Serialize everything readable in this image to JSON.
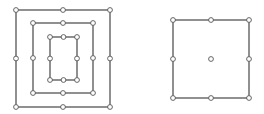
{
  "diagram": {
    "colors": {
      "stroke": "#555555",
      "node_fill": "#ffffff",
      "background": "#ffffff"
    },
    "figures": [
      {
        "name": "nested-squares",
        "cycles": [
          {
            "name": "outer-square",
            "vertex_count": 8
          },
          {
            "name": "middle-square",
            "vertex_count": 8
          },
          {
            "name": "inner-square",
            "vertex_count": 8
          }
        ],
        "isolated_vertices": 0
      },
      {
        "name": "single-square-with-center",
        "cycles": [
          {
            "name": "square",
            "vertex_count": 8
          }
        ],
        "isolated_vertices": 1
      }
    ]
  }
}
